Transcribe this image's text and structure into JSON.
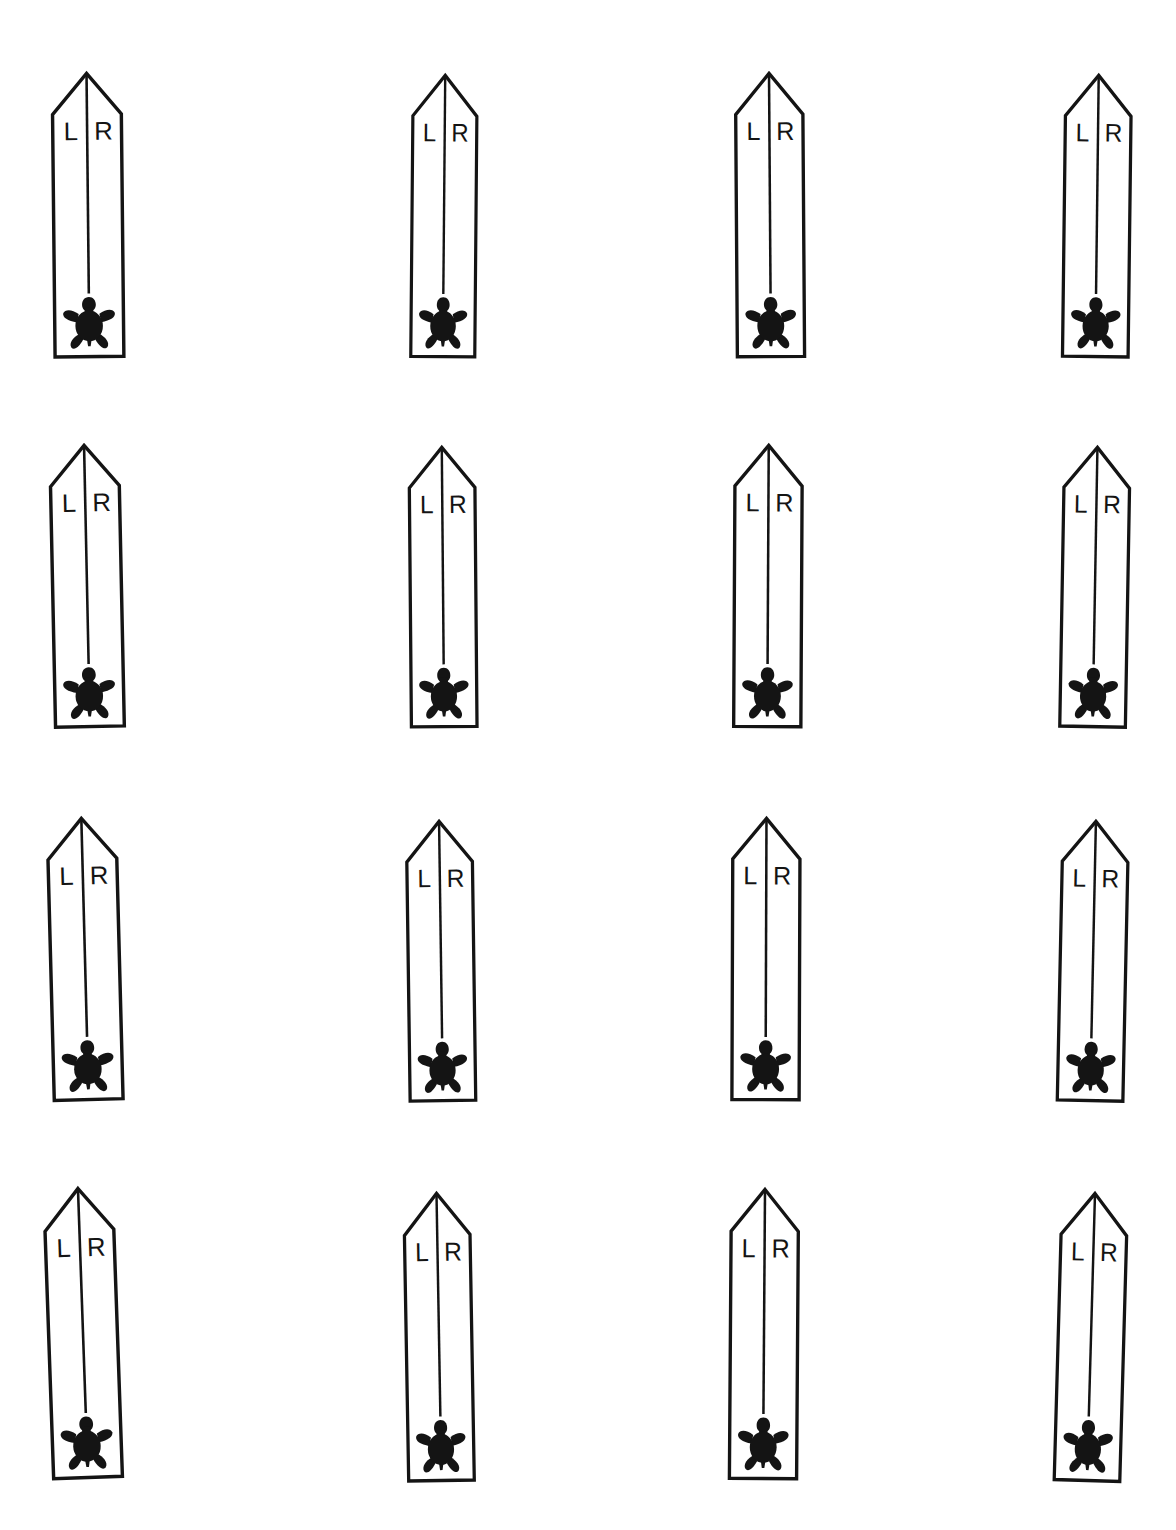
{
  "page": {
    "background_color": "#ffffff",
    "ink_color": "#141414",
    "width": 1176,
    "height": 1530,
    "grid": {
      "rows": 4,
      "columns": 4,
      "total_markers": 16
    }
  },
  "marker_template": {
    "label_left": "L",
    "label_right": "R",
    "icon_name": "turtle-icon",
    "shape_name": "obelisk-arrow-outline",
    "centerline_name": "center-divider-line",
    "outline_stroke_width": 4,
    "centerline_stroke_width": 3,
    "letter_font_size": 30
  },
  "markers": [
    {
      "id": "marker-r1c1",
      "row": 1,
      "column": 1,
      "left": 45,
      "top": 70,
      "width": 86,
      "height": 290,
      "rotation": -0.6,
      "label_left": "L",
      "label_right": "R"
    },
    {
      "id": "marker-r1c2",
      "row": 1,
      "column": 2,
      "left": 404,
      "top": 72,
      "width": 80,
      "height": 288,
      "rotation": 0.5,
      "label_left": "L",
      "label_right": "R"
    },
    {
      "id": "marker-r1c3",
      "row": 1,
      "column": 3,
      "left": 728,
      "top": 70,
      "width": 84,
      "height": 290,
      "rotation": -0.4,
      "label_left": "L",
      "label_right": "R"
    },
    {
      "id": "marker-r1c4",
      "row": 1,
      "column": 4,
      "left": 1056,
      "top": 72,
      "width": 82,
      "height": 288,
      "rotation": 0.7,
      "label_left": "L",
      "label_right": "R"
    },
    {
      "id": "marker-r2c1",
      "row": 2,
      "column": 1,
      "left": 44,
      "top": 442,
      "width": 86,
      "height": 288,
      "rotation": -1.2,
      "label_left": "L",
      "label_right": "R"
    },
    {
      "id": "marker-r2c2",
      "row": 2,
      "column": 2,
      "left": 402,
      "top": 444,
      "width": 82,
      "height": 286,
      "rotation": -0.5,
      "label_left": "L",
      "label_right": "R"
    },
    {
      "id": "marker-r2c3",
      "row": 2,
      "column": 3,
      "left": 726,
      "top": 442,
      "width": 84,
      "height": 288,
      "rotation": 0.3,
      "label_left": "L",
      "label_right": "R"
    },
    {
      "id": "marker-r2c4",
      "row": 2,
      "column": 4,
      "left": 1054,
      "top": 444,
      "width": 82,
      "height": 286,
      "rotation": 1.0,
      "label_left": "L",
      "label_right": "R"
    },
    {
      "id": "marker-r3c1",
      "row": 3,
      "column": 1,
      "left": 42,
      "top": 815,
      "width": 86,
      "height": 288,
      "rotation": -1.5,
      "label_left": "L",
      "label_right": "R"
    },
    {
      "id": "marker-r3c2",
      "row": 3,
      "column": 2,
      "left": 400,
      "top": 818,
      "width": 82,
      "height": 286,
      "rotation": -0.8,
      "label_left": "L",
      "label_right": "R"
    },
    {
      "id": "marker-r3c3",
      "row": 3,
      "column": 3,
      "left": 724,
      "top": 815,
      "width": 84,
      "height": 288,
      "rotation": 0.2,
      "label_left": "L",
      "label_right": "R"
    },
    {
      "id": "marker-r3c4",
      "row": 3,
      "column": 4,
      "left": 1052,
      "top": 818,
      "width": 82,
      "height": 286,
      "rotation": 1.2,
      "label_left": "L",
      "label_right": "R"
    },
    {
      "id": "marker-r4c1",
      "row": 4,
      "column": 1,
      "left": 40,
      "top": 1185,
      "width": 86,
      "height": 296,
      "rotation": -2.0,
      "label_left": "L",
      "label_right": "R"
    },
    {
      "id": "marker-r4c2",
      "row": 4,
      "column": 2,
      "left": 398,
      "top": 1190,
      "width": 82,
      "height": 294,
      "rotation": -1.0,
      "label_left": "L",
      "label_right": "R"
    },
    {
      "id": "marker-r4c3",
      "row": 4,
      "column": 3,
      "left": 722,
      "top": 1186,
      "width": 84,
      "height": 296,
      "rotation": 0.4,
      "label_left": "L",
      "label_right": "R"
    },
    {
      "id": "marker-r4c4",
      "row": 4,
      "column": 4,
      "left": 1050,
      "top": 1190,
      "width": 82,
      "height": 294,
      "rotation": 1.6,
      "label_left": "L",
      "label_right": "R"
    }
  ]
}
